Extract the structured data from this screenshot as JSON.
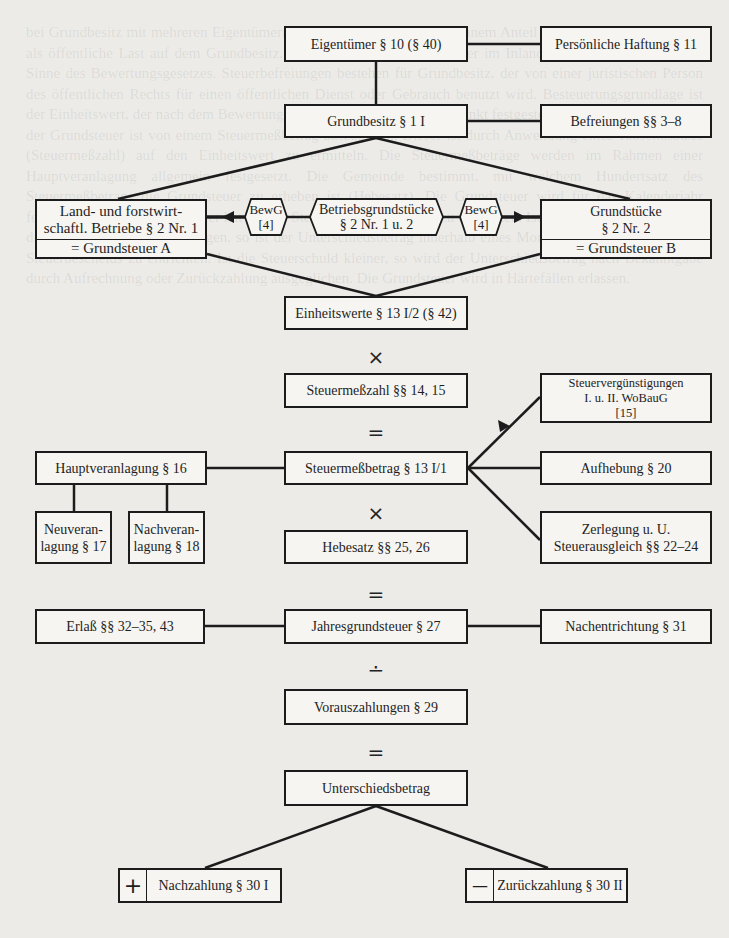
{
  "diagram": {
    "nodes": {
      "eigentuemer": "Eigentümer § 10 (§ 40)",
      "haftung": "Persönliche Haftung § 11",
      "grundbesitz": "Grundbesitz § 1 I",
      "befreiungen": "Befreiungen §§ 3–8",
      "landforst_top": "Land- und forstwirt-schaftl. Betriebe § 2 Nr. 1",
      "landforst_line1": "Land- und forstwirt-",
      "landforst_line2": "schaftl. Betriebe § 2 Nr. 1",
      "grundsteuer_a": "= Grundsteuer A",
      "bewg_left_1": "BewG",
      "bewg_left_2": "[4]",
      "betriebsgrund_1": "Betriebsgrundstücke",
      "betriebsgrund_2": "§ 2 Nr. 1 u. 2",
      "bewg_right_1": "BewG",
      "bewg_right_2": "[4]",
      "grundstuecke_1": "Grundstücke",
      "grundstuecke_2": "§ 2 Nr. 2",
      "grundsteuer_b": "= Grundsteuer B",
      "einheitswerte": "Einheitswerte § 13 I/2 (§ 42)",
      "steuermesszahl": "Steuermeßzahl §§ 14, 15",
      "steuerverg_1": "Steuervergünstigungen",
      "steuerverg_2": "I. u. II. WoBauG",
      "steuerverg_3": "[15]",
      "hauptveranlagung": "Hauptveranlagung § 16",
      "steuermessbetrag": "Steuermeßbetrag § 13 I/1",
      "aufhebung": "Aufhebung § 20",
      "neuveranlagung_1": "Neuveran-",
      "neuveranlagung_2": "lagung § 17",
      "nachveranlagung_1": "Nachveran-",
      "nachveranlagung_2": "lagung § 18",
      "hebesatz": "Hebesatz §§ 25, 26",
      "zerlegung_1": "Zerlegung u. U.",
      "zerlegung_2": "Steuerausgleich §§ 22–24",
      "erlass": "Erlaß §§ 32–35, 43",
      "jahresgrundsteuer": "Jahresgrundsteuer § 27",
      "nachentrichtung": "Nachentrichtung § 31",
      "vorauszahlungen": "Vorauszahlungen § 29",
      "unterschiedsbetrag": "Unterschiedsbetrag",
      "nachzahlung": "Nachzahlung § 30 I",
      "nachzahlung_sign": "+",
      "zurueckzahlung": "Zurückzahlung § 30 II",
      "zurueckzahlung_sign": "—"
    },
    "operators": {
      "op1": "×",
      "op2": "=",
      "op3": "×",
      "op4": "=",
      "op5": "∸",
      "op6": "="
    },
    "colors": {
      "line": "#1c1c1c",
      "page": "#ecebe8",
      "box_fill": "#f6f5f2"
    }
  },
  "background_text": "bei Grundbesitz mit mehreren Eigentümern ist jeder Eigentümer nach seinem Anteil Schuldner. Die Steuer ruht als öffentliche Last auf dem Grundbesitz. Der Grundsteuer unterliegt der im Inland belegene Grundbesitz im Sinne des Bewertungsgesetzes. Steuerbefreiungen bestehen für Grundbesitz, der von einer juristischen Person des öffentlichen Rechts für einen öffentlichen Dienst oder Gebrauch benutzt wird. Besteuerungsgrundlage ist der Einheitswert, der nach dem Bewertungsgesetz im Veranlagungszeitpunkt festgestellt ist. Bei der Berechnung der Grundsteuer ist von einem Steuermeßbetrag auszugehen. Dieser ist durch Anwendung eines Tausendsatzes (Steuermeßzahl) auf den Einheitswert zu ermitteln. Die Steuermeßbeträge werden im Rahmen einer Hauptveranlagung allgemein festgesetzt. Die Gemeinde bestimmt, mit welchem Hundertsatz des Steuermeßbetrags die Grundsteuer zu erheben ist (Hebesatz). Die Grundsteuer wird für das Kalenderjahr festgesetzt. Der Steuerschuldner hat auf die Steuer Vorauszahlungen zu entrichten. Ist die Steuerschuld höher als die Summe der Vorauszahlungen, so ist der Unterschiedsbetrag innerhalb eines Monats nach Bekanntgabe des Steuerbescheids zu entrichten. Ist die Steuerschuld kleiner, so wird der Unterschiedsbetrag nach Bekanntgabe durch Aufrechnung oder Zurückzahlung ausgeglichen. Die Grundsteuer wird in Härtefällen erlassen."
}
